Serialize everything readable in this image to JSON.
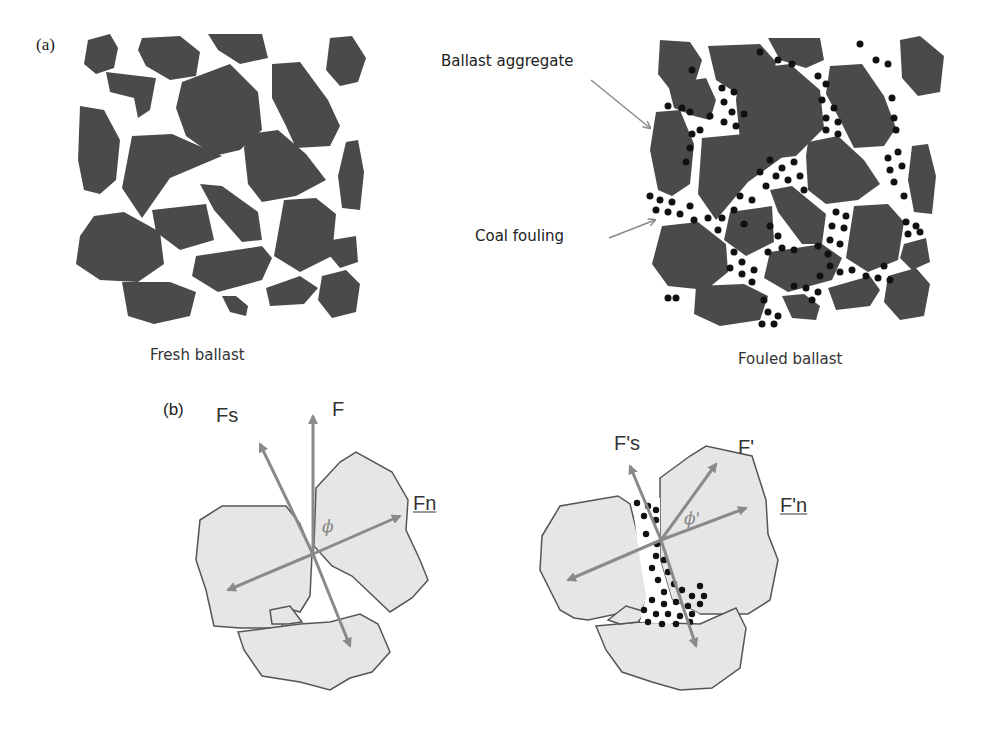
{
  "panel_a": {
    "label": "(a)",
    "fresh_caption": "Fresh ballast",
    "fouled_caption": "Fouled ballast",
    "annotations": {
      "aggregate": "Ballast aggregate",
      "fouling": "Coal fouling"
    }
  },
  "panel_b": {
    "label": "(b)",
    "left": {
      "fs": "Fs",
      "f": "F",
      "fn": "Fn",
      "angle": "ϕ"
    },
    "right": {
      "fs": "F's",
      "f": "F'",
      "fn": "F'n",
      "angle": "ϕ'"
    }
  },
  "colors": {
    "aggregate_dark": "#4a4a4a",
    "aggregate_light": "#e6e6e6",
    "arrow": "#8a8a8a",
    "coal": "#111111"
  }
}
